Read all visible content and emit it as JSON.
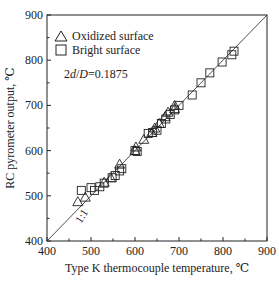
{
  "chart_data": {
    "type": "scatter",
    "title": "",
    "xlabel": "Type K thermocouple temperature, ℃",
    "ylabel": "RC pyrometer output, ℃",
    "xlim": [
      400,
      900
    ],
    "ylim": [
      400,
      900
    ],
    "xticks": [
      "400",
      "500",
      "600",
      "700",
      "800",
      "900"
    ],
    "yticks": [
      "400",
      "500",
      "600",
      "700",
      "800",
      "900"
    ],
    "grid": false,
    "legend_position": "top-left",
    "annotations": [
      "2d/D=0.1875",
      "1:1"
    ],
    "reference_line": {
      "label": "1:1",
      "from": [
        400,
        400
      ],
      "to": [
        900,
        900
      ]
    },
    "series": [
      {
        "name": "Oxidized surface",
        "marker": "triangle",
        "points": [
          [
            470,
            487
          ],
          [
            487,
            497
          ],
          [
            530,
            530
          ],
          [
            545,
            540
          ],
          [
            565,
            570
          ],
          [
            600,
            600
          ],
          [
            602,
            608
          ],
          [
            620,
            625
          ],
          [
            638,
            640
          ],
          [
            645,
            650
          ],
          [
            655,
            660
          ],
          [
            668,
            675
          ],
          [
            675,
            685
          ],
          [
            690,
            700
          ],
          [
            690,
            693
          ]
        ]
      },
      {
        "name": "Bright surface",
        "marker": "square",
        "points": [
          [
            478,
            512
          ],
          [
            500,
            518
          ],
          [
            508,
            512
          ],
          [
            520,
            520
          ],
          [
            530,
            528
          ],
          [
            548,
            540
          ],
          [
            555,
            545
          ],
          [
            565,
            555
          ],
          [
            570,
            560
          ],
          [
            600,
            600
          ],
          [
            605,
            598
          ],
          [
            630,
            638
          ],
          [
            640,
            640
          ],
          [
            650,
            645
          ],
          [
            660,
            660
          ],
          [
            670,
            670
          ],
          [
            680,
            680
          ],
          [
            690,
            690
          ],
          [
            700,
            700
          ],
          [
            730,
            723
          ],
          [
            750,
            750
          ],
          [
            770,
            772
          ],
          [
            798,
            796
          ],
          [
            820,
            812
          ],
          [
            825,
            820
          ]
        ]
      }
    ]
  },
  "legend": {
    "oxidized": "Oxidized surface",
    "bright": "Bright surface",
    "ratio_prefix": "2",
    "ratio_d": "d",
    "ratio_sep": "/",
    "ratio_D": "D",
    "ratio_value": "=0.1875"
  },
  "labels": {
    "one_to_one": "1:1"
  }
}
